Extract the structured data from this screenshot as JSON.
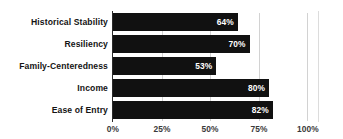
{
  "chart_data": {
    "type": "bar",
    "orientation": "horizontal",
    "title": "",
    "subtitle": "",
    "xlabel": "",
    "ylabel": "",
    "categories": [
      "Historical Stability",
      "Resiliency",
      "Family-Centeredness",
      "Income",
      "Ease of Entry"
    ],
    "values": [
      64,
      70,
      53,
      80,
      82
    ],
    "data_labels": [
      "64%",
      "70%",
      "53%",
      "80%",
      "82%"
    ],
    "xlim": [
      0,
      100
    ],
    "xticks": [
      0,
      25,
      50,
      75,
      100
    ],
    "xtick_labels": [
      "0%",
      "25%",
      "50%",
      "75%",
      "100%"
    ],
    "grid": true,
    "grid_axis": "x",
    "legend": false,
    "legend_position": "none",
    "bar_color": "#111111",
    "data_label_color": "#ffffff",
    "gridline_color": "#d2d2d2",
    "axis_line_color": "#2b2b2b",
    "background_color": "#ffffff",
    "category_label_color": "#141414",
    "tick_label_color": "#3a3a3a"
  }
}
